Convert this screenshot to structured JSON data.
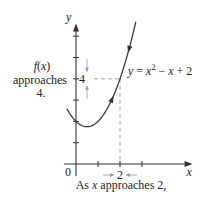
{
  "chart_data": {
    "type": "line",
    "title": "",
    "function": "y = x^2 - x + 2",
    "xlabel": "x",
    "ylabel": "y",
    "xlim": [
      -0.55,
      5.3
    ],
    "ylim": [
      0,
      6.6
    ],
    "x_ticks": [
      1,
      2,
      3
    ],
    "y_ticks": [
      1,
      2,
      3,
      4,
      5,
      6
    ],
    "origin_label": "0",
    "x_tick_label": "2",
    "y_tick_label": "4",
    "curve_domain": [
      -0.42,
      2.72
    ],
    "highlight_point": {
      "x": 2,
      "y": 4
    },
    "curve_label": "y = x² − x + 2",
    "curve_label_parts": {
      "lhs": "y",
      "eq": " = ",
      "x1": "x",
      "sup": "2",
      "minus": " − ",
      "x2": "x",
      "plus": " + 2"
    },
    "annotations": {
      "left_line1": "f(x)",
      "left_line2": "approaches",
      "left_line3": "4.",
      "bottom": "As x approaches 2,"
    },
    "colors": {
      "curve": "#3a3a3a",
      "dashed_guides": "#9a9a9a",
      "axes": "#333333"
    }
  }
}
